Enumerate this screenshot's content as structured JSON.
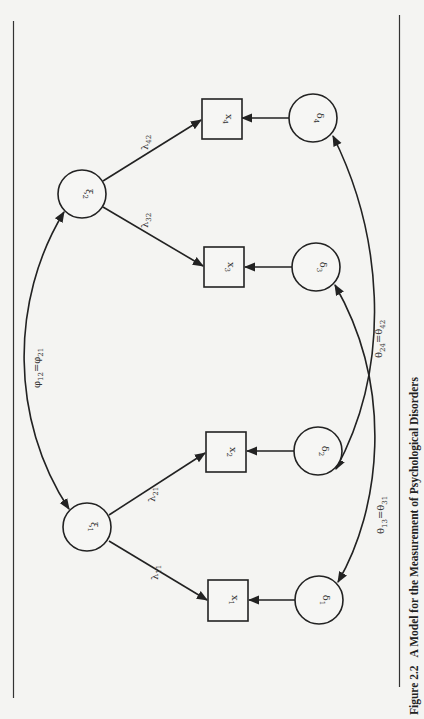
{
  "figure": {
    "caption_number": "Figure 2.2",
    "caption_title": "A Model for the Measurement of Psychological Disorders",
    "orientation": "rotated 90° clockwise (text reads bottom-to-top)"
  },
  "latent": [
    {
      "id": "xi1",
      "sym": "ξ",
      "sub": "1"
    },
    {
      "id": "xi2",
      "sym": "ξ",
      "sub": "2"
    }
  ],
  "observed": [
    {
      "id": "x1",
      "sym": "x",
      "sub": "1"
    },
    {
      "id": "x2",
      "sym": "x",
      "sub": "2"
    },
    {
      "id": "x3",
      "sym": "x",
      "sub": "3"
    },
    {
      "id": "x4",
      "sym": "x",
      "sub": "4"
    }
  ],
  "errors": [
    {
      "id": "d1",
      "sym": "δ",
      "sub": "1"
    },
    {
      "id": "d2",
      "sym": "δ",
      "sub": "2"
    },
    {
      "id": "d3",
      "sym": "δ",
      "sub": "3"
    },
    {
      "id": "d4",
      "sym": "δ",
      "sub": "4"
    }
  ],
  "loadings": [
    {
      "from": "xi1",
      "to": "x1",
      "sym": "λ",
      "sub": "11"
    },
    {
      "from": "xi1",
      "to": "x2",
      "sym": "λ",
      "sub": "21"
    },
    {
      "from": "xi2",
      "to": "x3",
      "sym": "λ",
      "sub": "32"
    },
    {
      "from": "xi2",
      "to": "x4",
      "sym": "λ",
      "sub": "42"
    }
  ],
  "covariances": [
    {
      "between": [
        "xi1",
        "xi2"
      ],
      "a": "φ",
      "a_sub": "12",
      "eq": "=",
      "b": "φ",
      "b_sub": "21"
    },
    {
      "between": [
        "d1",
        "d3"
      ],
      "a": "θ",
      "a_sub": "13",
      "eq": "=",
      "b": "θ",
      "b_sub": "31"
    },
    {
      "between": [
        "d2",
        "d4"
      ],
      "a": "θ",
      "a_sub": "24",
      "eq": "=",
      "b": "θ",
      "b_sub": "42"
    }
  ]
}
